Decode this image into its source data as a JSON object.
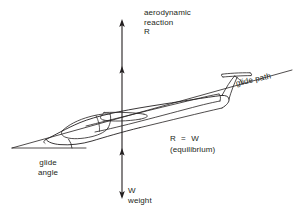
{
  "diagram": {
    "background_color": "#ffffff",
    "ink_color": "#231f20",
    "labels": {
      "aerodynamic_reaction_line1": "aerodynamic",
      "aerodynamic_reaction_line2": "reaction",
      "aerodynamic_reaction_symbol": "R",
      "weight_symbol": "W",
      "weight_word": "weight",
      "equilibrium_equation": "R  =  W",
      "equilibrium_note": "(equilibrium)",
      "glide_angle_line1": "glide",
      "glide_angle_line2": "angle",
      "glide_path": "glide path"
    },
    "forces": [
      {
        "name": "aerodynamic-reaction",
        "symbol": "R",
        "direction": "up",
        "label": "aerodynamic reaction"
      },
      {
        "name": "weight",
        "symbol": "W",
        "direction": "down",
        "label": "weight"
      }
    ],
    "relation": "R = W",
    "condition": "equilibrium"
  }
}
